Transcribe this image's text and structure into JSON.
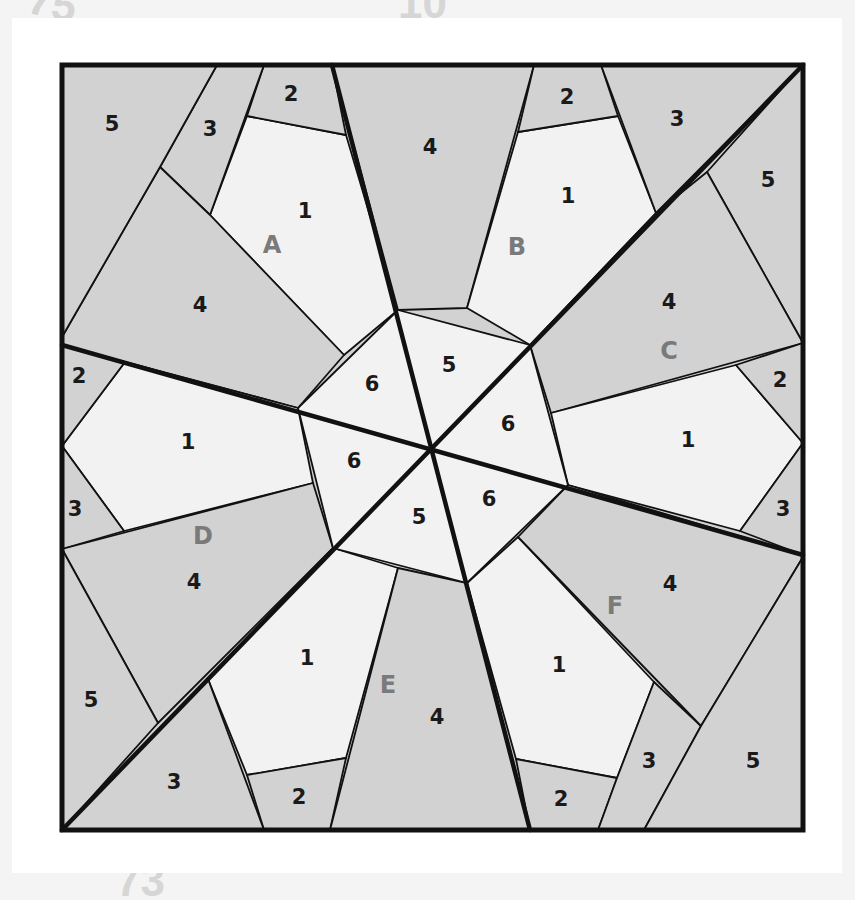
{
  "page": {
    "ghost_numbers": [
      "75",
      "10",
      "73"
    ]
  },
  "colors": {
    "light_fill": "#f2f2f2",
    "dark_fill": "#d2d2d2",
    "outline": "#111111",
    "block_label": "#7a7a7a"
  },
  "diagram": {
    "blocks": [
      "A",
      "B",
      "C",
      "D",
      "E",
      "F"
    ],
    "block_labels": [
      {
        "id": "A",
        "x": 272,
        "y": 246
      },
      {
        "id": "B",
        "x": 517,
        "y": 248
      },
      {
        "id": "C",
        "x": 669,
        "y": 352
      },
      {
        "id": "D",
        "x": 203,
        "y": 537
      },
      {
        "id": "E",
        "x": 388,
        "y": 686
      },
      {
        "id": "F",
        "x": 615,
        "y": 607
      }
    ],
    "piece_labels": [
      {
        "text": "5",
        "x": 112,
        "y": 125
      },
      {
        "text": "3",
        "x": 210,
        "y": 130
      },
      {
        "text": "2",
        "x": 291,
        "y": 95
      },
      {
        "text": "1",
        "x": 305,
        "y": 212
      },
      {
        "text": "4",
        "x": 430,
        "y": 148
      },
      {
        "text": "2",
        "x": 567,
        "y": 98
      },
      {
        "text": "1",
        "x": 568,
        "y": 197
      },
      {
        "text": "3",
        "x": 677,
        "y": 120
      },
      {
        "text": "5",
        "x": 768,
        "y": 181
      },
      {
        "text": "4",
        "x": 200,
        "y": 306
      },
      {
        "text": "4",
        "x": 669,
        "y": 303
      },
      {
        "text": "2",
        "x": 79,
        "y": 377
      },
      {
        "text": "1",
        "x": 188,
        "y": 443
      },
      {
        "text": "3",
        "x": 75,
        "y": 510
      },
      {
        "text": "2",
        "x": 780,
        "y": 381
      },
      {
        "text": "1",
        "x": 688,
        "y": 441
      },
      {
        "text": "3",
        "x": 783,
        "y": 510
      },
      {
        "text": "6",
        "x": 372,
        "y": 385
      },
      {
        "text": "5",
        "x": 449,
        "y": 366
      },
      {
        "text": "6",
        "x": 508,
        "y": 425
      },
      {
        "text": "6",
        "x": 354,
        "y": 462
      },
      {
        "text": "5",
        "x": 419,
        "y": 518
      },
      {
        "text": "6",
        "x": 489,
        "y": 500
      },
      {
        "text": "4",
        "x": 194,
        "y": 583
      },
      {
        "text": "4",
        "x": 670,
        "y": 585
      },
      {
        "text": "1",
        "x": 307,
        "y": 659
      },
      {
        "text": "1",
        "x": 559,
        "y": 666
      },
      {
        "text": "5",
        "x": 91,
        "y": 701
      },
      {
        "text": "4",
        "x": 437,
        "y": 718
      },
      {
        "text": "3",
        "x": 174,
        "y": 783
      },
      {
        "text": "2",
        "x": 299,
        "y": 798
      },
      {
        "text": "2",
        "x": 561,
        "y": 800
      },
      {
        "text": "3",
        "x": 649,
        "y": 762
      },
      {
        "text": "5",
        "x": 753,
        "y": 762
      }
    ]
  }
}
